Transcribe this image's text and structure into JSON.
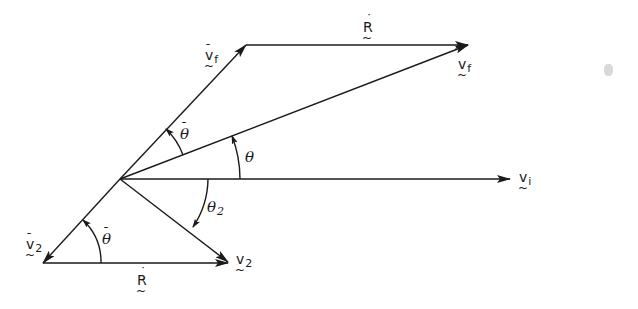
{
  "diagram": {
    "type": "vector-diagram",
    "colors": {
      "ink": "#1a1a1a",
      "background": "#ffffff"
    },
    "points": {
      "origin": [
        120,
        179
      ],
      "vf_bar_tip": [
        246,
        45
      ],
      "vf_tip": [
        468,
        45
      ],
      "vi_tip": [
        510,
        179
      ],
      "v2_bar_tip": [
        43,
        263
      ],
      "v2_tip": [
        228,
        262
      ]
    },
    "vectors": [
      {
        "id": "vf_bar",
        "from": "origin",
        "to": "vf_bar_tip",
        "label": "v̄f"
      },
      {
        "id": "R_dot_top",
        "from": "vf_bar_tip",
        "to": "vf_tip",
        "label": "Ṙ"
      },
      {
        "id": "vf",
        "from": "origin",
        "to": "vf_tip",
        "label": "vf"
      },
      {
        "id": "vi",
        "from": "origin",
        "to": "vi_tip",
        "label": "vi"
      },
      {
        "id": "v2_bar",
        "from": "origin",
        "to": "v2_bar_tip",
        "label": "v̄2"
      },
      {
        "id": "v2",
        "from": "origin",
        "to": "v2_tip",
        "label": "v2"
      },
      {
        "id": "R_dot_bottom",
        "from": "v2_bar_tip",
        "to": "v2_tip",
        "label": "Ṙ"
      }
    ],
    "angles": [
      {
        "id": "theta_bar_top",
        "label": "θ̄",
        "between": [
          "vf",
          "vf_bar"
        ]
      },
      {
        "id": "theta",
        "label": "θ",
        "between": [
          "vi",
          "vf"
        ]
      },
      {
        "id": "theta_2",
        "label": "θ2",
        "between": [
          "vi",
          "v2"
        ]
      },
      {
        "id": "theta_bar_bottom",
        "label": "θ̄",
        "between": [
          "R_dot_bottom",
          "v2_bar"
        ]
      }
    ]
  },
  "labels": {
    "R_top": {
      "main": "R",
      "accent": "˙",
      "under": "~"
    },
    "vf_bar": {
      "main": "v",
      "sub": "f",
      "accent": "¯",
      "under": "~"
    },
    "vf": {
      "main": "v",
      "sub": "f",
      "under": "~"
    },
    "vi": {
      "main": "v",
      "sub": "i",
      "under": "~"
    },
    "v2_bar": {
      "main": "v",
      "sub": "2",
      "accent": "¯",
      "under": "~"
    },
    "v2": {
      "main": "v",
      "sub": "2",
      "under": "~"
    },
    "R_bottom": {
      "main": "R",
      "accent": "˙",
      "under": "~"
    },
    "theta_bar_top": {
      "main": "θ",
      "accent": "¯"
    },
    "theta": {
      "main": "θ"
    },
    "theta_2": {
      "main": "θ",
      "sub": "2"
    },
    "theta_bar_bottom": {
      "main": "θ",
      "accent": "¯"
    }
  }
}
